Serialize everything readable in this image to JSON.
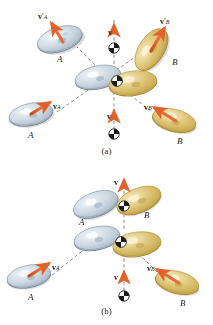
{
  "figure": {
    "type": "two-dimensional-collision-diagram",
    "colors": {
      "puck_a_fill": "#c6d3de",
      "puck_a_fill_light": "#e3ebf2",
      "puck_a_rim": "#8a99a8",
      "puck_b_fill": "#ddc473",
      "puck_b_fill_light": "#f0e3b2",
      "puck_b_rim": "#b08f3c",
      "arrow": "#e2622b",
      "arrow_dark": "#c24a18",
      "dashed_line": "#6e6e72",
      "text": "#231f20",
      "cm_marker_dark": "#1a1a1a",
      "cm_marker_light": "#ffffff",
      "shadow": "#b9b9bd"
    }
  },
  "panels": [
    {
      "id": "a",
      "caption": "(a)",
      "labels": {
        "puck_a_incoming": "A",
        "puck_a_outgoing": "A",
        "puck_b_incoming": "B",
        "puck_b_outgoing": "B",
        "v_a": {
          "symbol": "v",
          "sub": "A",
          "prime": ""
        },
        "v_a_prime": {
          "symbol": "v",
          "sub": "A",
          "prime": "′"
        },
        "v_b": {
          "symbol": "v",
          "sub": "B",
          "prime": ""
        },
        "v_b_prime": {
          "symbol": "v",
          "sub": "B",
          "prime": "′"
        },
        "v_cm_top": {
          "symbol": "v",
          "sub": "",
          "prime": ""
        },
        "v_cm_bottom": {
          "symbol": "v",
          "sub": "",
          "prime": ""
        }
      }
    },
    {
      "id": "b",
      "caption": "(b)",
      "labels": {
        "puck_a_incoming": "A",
        "puck_a_outgoing": "A",
        "puck_b_incoming": "B",
        "puck_b_outgoing": "B",
        "v_a": {
          "symbol": "v",
          "sub": "A",
          "prime": ""
        },
        "v_b": {
          "symbol": "v",
          "sub": "B",
          "prime": ""
        },
        "v_cm_top": {
          "symbol": "v",
          "sub": "",
          "prime": ""
        },
        "v_cm_bottom": {
          "symbol": "v",
          "sub": "",
          "prime": ""
        }
      }
    }
  ]
}
